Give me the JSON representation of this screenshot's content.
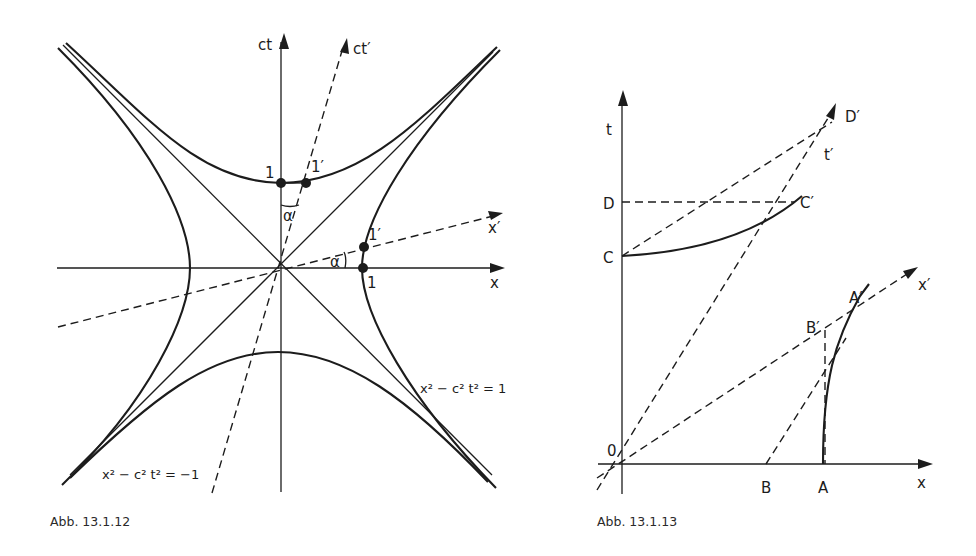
{
  "figure_left": {
    "caption": "Abb. 13.1.12",
    "axis_labels": {
      "ct": "ct",
      "ct_prime": "ct′",
      "x": "x",
      "x_prime": "x′"
    },
    "point_labels": {
      "one_ct": "1",
      "one_prime_ct": "1′",
      "one_x": "1",
      "one_prime_x": "1′"
    },
    "angle_labels": {
      "alpha_top": "α",
      "alpha_right": "α"
    },
    "equations": {
      "timelike": "x² − c² t² = 1",
      "spacelike": "x² − c² t² = −1"
    }
  },
  "figure_right": {
    "caption": "Abb. 13.1.13",
    "axis_labels": {
      "t": "t",
      "t_prime": "t′",
      "x": "x",
      "x_prime": "x′"
    },
    "point_labels": {
      "origin": "0",
      "A": "A",
      "B": "B",
      "C": "C",
      "D": "D",
      "A_prime": "A′",
      "B_prime": "B′",
      "C_prime": "C′",
      "D_prime": "D′"
    }
  }
}
